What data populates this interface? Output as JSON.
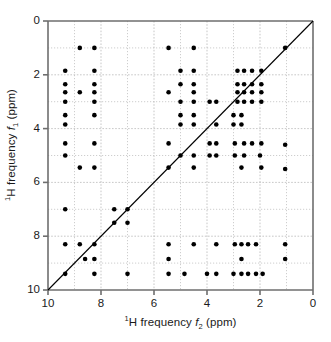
{
  "chart_data": {
    "type": "scatter",
    "title": "",
    "subtitle": "",
    "xlabel": "1H frequency f2 (ppm)",
    "ylabel": "1H frequency f1 (ppm)",
    "xlabel_parts": {
      "pre_sup": "1",
      "main": "H frequency ",
      "italic": "f",
      "sub": "2",
      "post": " (ppm)"
    },
    "ylabel_parts": {
      "pre_sup": "1",
      "main": "H frequency ",
      "italic": "f",
      "sub": "1",
      "post": " (ppm)"
    },
    "xlim": [
      10,
      0
    ],
    "ylim": [
      0,
      10
    ],
    "x_axis_reversed": true,
    "y_axis_reversed": true,
    "major_ticks_x": [
      10,
      8,
      6,
      4,
      2,
      0
    ],
    "major_ticks_y": [
      0,
      2,
      4,
      6,
      8,
      10
    ],
    "minor_gridlines_x": [
      9,
      7,
      5,
      3,
      1
    ],
    "minor_gridlines_y": [
      1,
      3,
      5,
      7,
      9
    ],
    "xtick_labels": [
      "10",
      "8",
      "6",
      "4",
      "2",
      "0"
    ],
    "ytick_labels": [
      "0",
      "2",
      "4",
      "6",
      "8",
      "10"
    ],
    "grid": true,
    "grid_style": "dotted",
    "legend": "none",
    "marker": "filled-circle",
    "marker_color": "#000000",
    "marker_size_px": 4.6,
    "diagonal_line": {
      "from": [
        10,
        10
      ],
      "to": [
        0,
        0
      ],
      "color": "#000000",
      "width": 1.1
    },
    "axis_color": "#6e6e6e",
    "gridline_color": "#b9b9b9",
    "background": "#ffffff",
    "n_points": 186,
    "points": [
      [
        8.8,
        1.0
      ],
      [
        8.25,
        1.0
      ],
      [
        5.45,
        1.0
      ],
      [
        4.5,
        1.0
      ],
      [
        1.05,
        1.0
      ],
      [
        9.35,
        1.85
      ],
      [
        8.25,
        1.85
      ],
      [
        5.0,
        1.85
      ],
      [
        4.5,
        1.85
      ],
      [
        2.85,
        1.85
      ],
      [
        2.6,
        1.85
      ],
      [
        2.3,
        1.85
      ],
      [
        1.95,
        1.85
      ],
      [
        9.35,
        2.35
      ],
      [
        8.25,
        2.35
      ],
      [
        5.0,
        2.35
      ],
      [
        4.5,
        2.35
      ],
      [
        2.85,
        2.35
      ],
      [
        2.6,
        2.35
      ],
      [
        2.3,
        2.35
      ],
      [
        1.95,
        2.35
      ],
      [
        9.35,
        2.65
      ],
      [
        8.8,
        2.65
      ],
      [
        8.25,
        2.65
      ],
      [
        5.45,
        2.65
      ],
      [
        4.5,
        2.65
      ],
      [
        2.85,
        2.65
      ],
      [
        2.6,
        2.65
      ],
      [
        2.3,
        2.65
      ],
      [
        1.95,
        2.65
      ],
      [
        9.35,
        3.0
      ],
      [
        8.25,
        3.0
      ],
      [
        5.0,
        3.0
      ],
      [
        4.5,
        3.0
      ],
      [
        3.9,
        3.0
      ],
      [
        3.65,
        3.0
      ],
      [
        2.85,
        3.0
      ],
      [
        2.6,
        3.0
      ],
      [
        2.3,
        3.0
      ],
      [
        1.95,
        3.0
      ],
      [
        9.35,
        3.5
      ],
      [
        8.25,
        3.5
      ],
      [
        5.0,
        3.5
      ],
      [
        4.5,
        3.5
      ],
      [
        3.0,
        3.5
      ],
      [
        2.7,
        3.5
      ],
      [
        9.35,
        3.85
      ],
      [
        5.0,
        3.85
      ],
      [
        4.5,
        3.85
      ],
      [
        3.65,
        3.85
      ],
      [
        3.0,
        3.85
      ],
      [
        2.7,
        3.85
      ],
      [
        9.35,
        4.55
      ],
      [
        8.25,
        4.55
      ],
      [
        5.45,
        4.55
      ],
      [
        3.9,
        4.55
      ],
      [
        3.65,
        4.55
      ],
      [
        2.95,
        4.55
      ],
      [
        2.6,
        4.55
      ],
      [
        2.3,
        4.55
      ],
      [
        1.95,
        4.55
      ],
      [
        1.05,
        4.6
      ],
      [
        9.35,
        5.0
      ],
      [
        5.0,
        5.0
      ],
      [
        4.5,
        5.0
      ],
      [
        3.9,
        5.0
      ],
      [
        3.65,
        5.0
      ],
      [
        2.95,
        5.0
      ],
      [
        2.6,
        5.0
      ],
      [
        2.0,
        5.0
      ],
      [
        8.8,
        5.45
      ],
      [
        8.25,
        5.45
      ],
      [
        5.45,
        5.45
      ],
      [
        4.5,
        5.45
      ],
      [
        2.7,
        5.45
      ],
      [
        1.95,
        5.45
      ],
      [
        1.05,
        5.5
      ],
      [
        9.35,
        7.0
      ],
      [
        7.5,
        7.0
      ],
      [
        7.0,
        7.0
      ],
      [
        7.5,
        7.5
      ],
      [
        7.0,
        7.5
      ],
      [
        9.35,
        8.3
      ],
      [
        8.8,
        8.3
      ],
      [
        8.25,
        8.3
      ],
      [
        5.45,
        8.3
      ],
      [
        4.5,
        8.3
      ],
      [
        3.65,
        8.3
      ],
      [
        2.95,
        8.3
      ],
      [
        2.7,
        8.3
      ],
      [
        2.45,
        8.3
      ],
      [
        2.15,
        8.3
      ],
      [
        1.05,
        8.3
      ],
      [
        8.6,
        8.85
      ],
      [
        8.25,
        8.85
      ],
      [
        5.45,
        8.85
      ],
      [
        2.7,
        8.85
      ],
      [
        1.05,
        8.85
      ],
      [
        9.35,
        9.4
      ],
      [
        8.25,
        9.4
      ],
      [
        7.0,
        9.4
      ],
      [
        5.45,
        9.4
      ],
      [
        4.85,
        9.4
      ],
      [
        4.0,
        9.4
      ],
      [
        3.65,
        9.4
      ],
      [
        3.0,
        9.4
      ],
      [
        2.7,
        9.4
      ],
      [
        2.45,
        9.4
      ],
      [
        2.15,
        9.4
      ],
      [
        1.9,
        9.4
      ]
    ]
  },
  "figure": {
    "caption": ""
  }
}
